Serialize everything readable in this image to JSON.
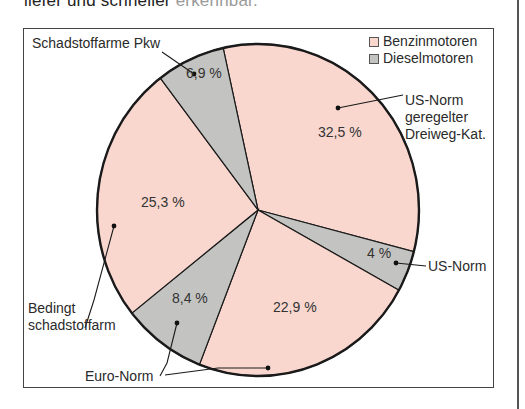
{
  "page": {
    "heading_visible": "liefer und schneller ",
    "heading_faded": "erkennbar."
  },
  "colors": {
    "benzin": "#f9d7cf",
    "diesel": "#c3c3c1",
    "outline": "#1a1a1a"
  },
  "legend": {
    "items": [
      {
        "label": "Benzinmotoren",
        "color": "#f9d7cf"
      },
      {
        "label": "Dieselmotoren",
        "color": "#c3c3c1"
      }
    ]
  },
  "labels": {
    "schadstoffarme_pkw": "Schadstoffarme Pkw",
    "us_norm_kat_1": "US-Norm",
    "us_norm_kat_2": "geregelter",
    "us_norm_kat_3": "Dreiweg-Kat.",
    "us_norm": "US-Norm",
    "bedingt_1": "Bedingt",
    "bedingt_2": "schadstoffarm",
    "euro_norm": "Euro-Norm"
  },
  "chart_data": {
    "type": "pie",
    "title": "",
    "legend_position": "top-right",
    "slices": [
      {
        "label": "US-Norm geregelter Dreiweg-Kat.",
        "engine": "Benzinmotoren",
        "value": 32.5,
        "display": "32,5 %"
      },
      {
        "label": "US-Norm",
        "engine": "Dieselmotoren",
        "value": 4.0,
        "display": "4 %"
      },
      {
        "label": "Euro-Norm",
        "engine": "Benzinmotoren",
        "value": 22.9,
        "display": "22,9 %"
      },
      {
        "label": "Euro-Norm",
        "engine": "Dieselmotoren",
        "value": 8.4,
        "display": "8,4 %"
      },
      {
        "label": "Bedingt schadstoffarm",
        "engine": "Benzinmotoren",
        "value": 25.3,
        "display": "25,3 %"
      },
      {
        "label": "Schadstoffarme Pkw",
        "engine": "Dieselmotoren",
        "value": 6.9,
        "display": "6,9 %"
      }
    ],
    "start_angle_deg": -12.5,
    "direction": "clockwise",
    "annotations": [
      "Schadstoffarme Pkw",
      "US-Norm geregelter Dreiweg-Kat.",
      "US-Norm",
      "Bedingt schadstoffarm",
      "Euro-Norm"
    ]
  }
}
